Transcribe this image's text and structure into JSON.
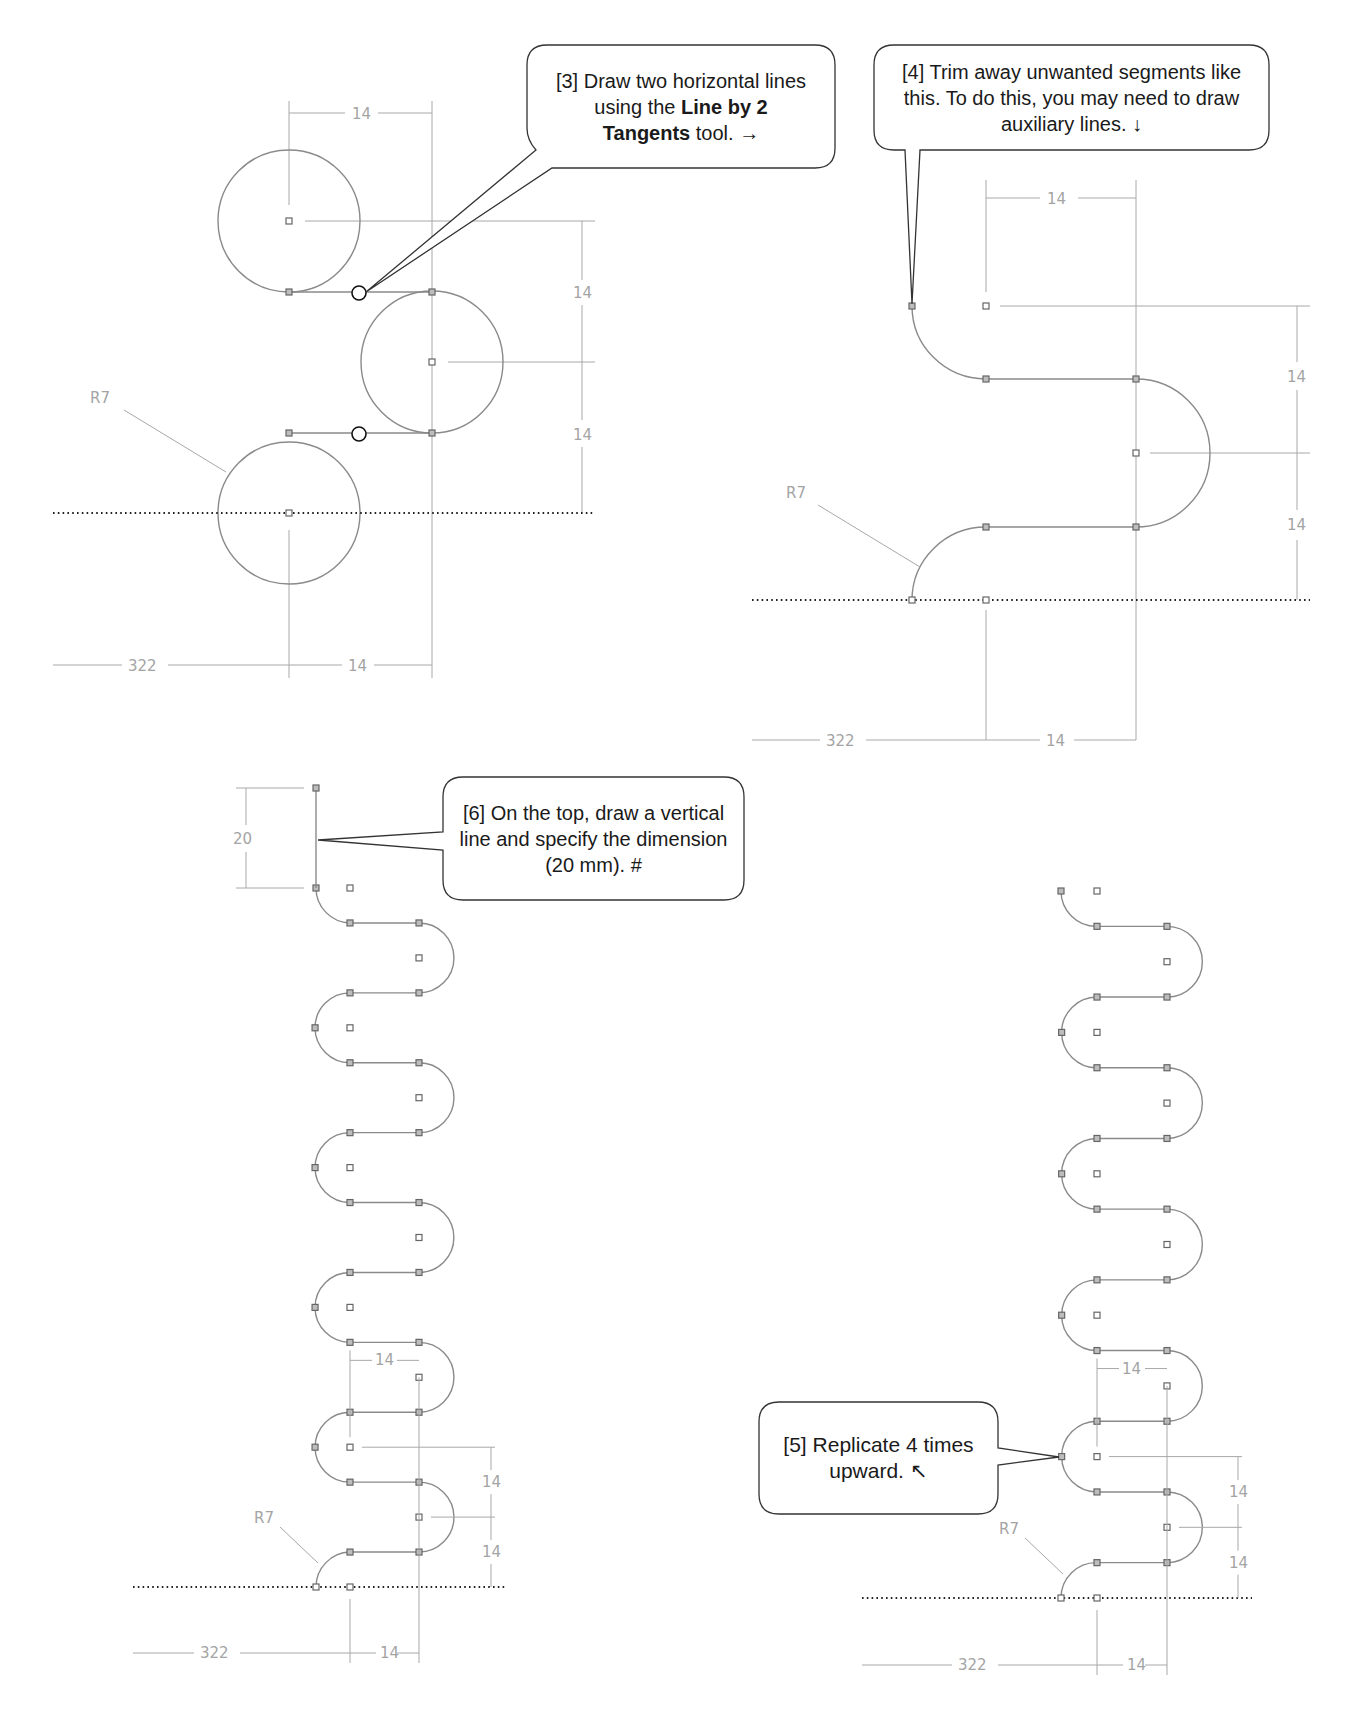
{
  "callouts": {
    "step3": {
      "prefix": "[3] Draw two horizontal lines using the ",
      "bold1": "Line by 2",
      "bold2": "Tangents",
      "suffix": " tool. →"
    },
    "step4": {
      "text": "[4] Trim away unwanted segments like this. To do this, you may need to draw auxiliary lines. ↓"
    },
    "step5": {
      "text": "[5] Replicate 4 times upward. ↖"
    },
    "step6": {
      "text": "[6] On the top, draw a vertical line and specify the dimension (20 mm). #"
    }
  },
  "dimensions": {
    "radius_label": "R7",
    "pitch_label": "14",
    "offset_label": "322",
    "top_line_label": "20"
  },
  "panels": {
    "top_left": {
      "title": "Three R7 circles with two tangent lines",
      "circle_radius_mm": 7,
      "spacing_mm": 14
    },
    "top_right": {
      "title": "Trimmed S-curve profile"
    },
    "bottom_left": {
      "title": "Replicated wave with 20 mm top line"
    },
    "bottom_right": {
      "title": "Wave replicated 4 times upward"
    }
  },
  "colors": {
    "geometry": "#8a8a8a",
    "dimension": "#a8a8a8",
    "callout_border": "#333333",
    "baseline": "#222222"
  }
}
